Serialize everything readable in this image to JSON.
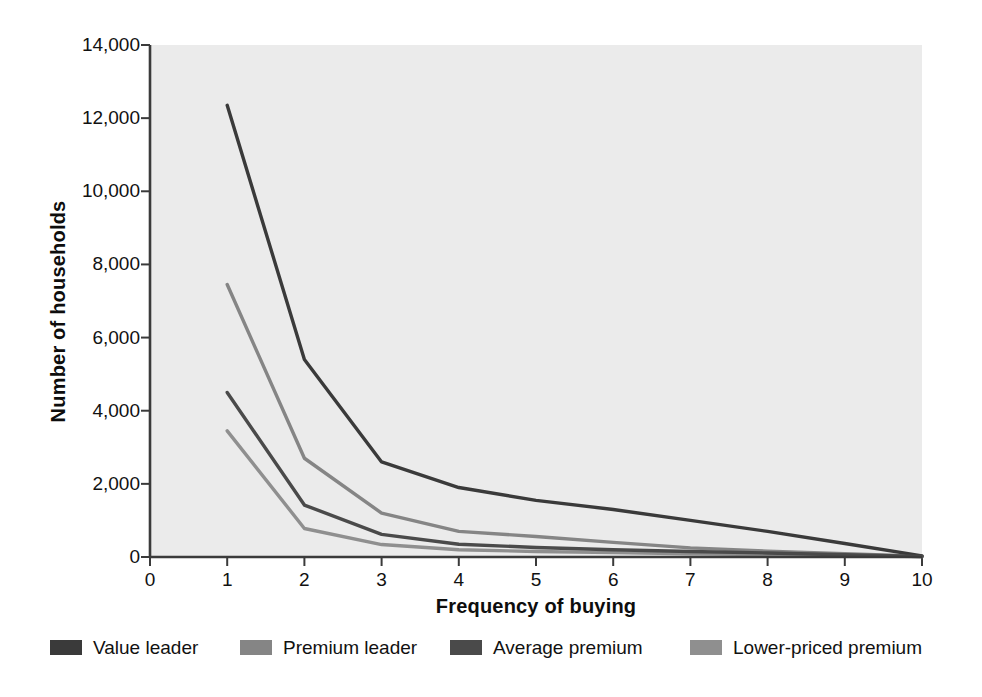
{
  "chart_data": {
    "type": "line",
    "title": "",
    "xlabel": "Frequency of buying",
    "ylabel": "Number of households",
    "xlim": [
      0,
      10
    ],
    "ylim": [
      0,
      14000
    ],
    "xticks": [
      "0",
      "1",
      "2",
      "3",
      "4",
      "5",
      "6",
      "7",
      "8",
      "9",
      "10"
    ],
    "yticks": [
      "0",
      "2,000",
      "4,000",
      "6,000",
      "8,000",
      "10,000",
      "12,000",
      "14,000"
    ],
    "ytick_values": [
      0,
      2000,
      4000,
      6000,
      8000,
      10000,
      12000,
      14000
    ],
    "grid": false,
    "legend_position": "below",
    "x": [
      1,
      2,
      3,
      4,
      5,
      6,
      7,
      8,
      9,
      10
    ],
    "series": [
      {
        "name": "Value leader",
        "color": "#3a3a3a",
        "values": [
          12350,
          5400,
          2600,
          1900,
          1550,
          1300,
          1000,
          700,
          370,
          30
        ]
      },
      {
        "name": "Premium leader",
        "color": "#858585",
        "values": [
          7450,
          2700,
          1200,
          700,
          560,
          400,
          250,
          160,
          90,
          20
        ]
      },
      {
        "name": "Average premium",
        "color": "#4a4a4a",
        "values": [
          4500,
          1420,
          620,
          350,
          260,
          200,
          150,
          110,
          60,
          15
        ]
      },
      {
        "name": "Lower-priced premium",
        "color": "#8f8f8f",
        "values": [
          3450,
          780,
          340,
          200,
          150,
          120,
          90,
          65,
          40,
          10
        ]
      }
    ],
    "plot_background": "#ebebeb",
    "axis_color": "#3b3b3b"
  },
  "legend": {
    "items": [
      {
        "label": "Value leader",
        "color": "#3a3a3a"
      },
      {
        "label": "Premium leader",
        "color": "#858585"
      },
      {
        "label": "Average premium",
        "color": "#4a4a4a"
      },
      {
        "label": "Lower-priced premium",
        "color": "#8f8f8f"
      }
    ]
  }
}
